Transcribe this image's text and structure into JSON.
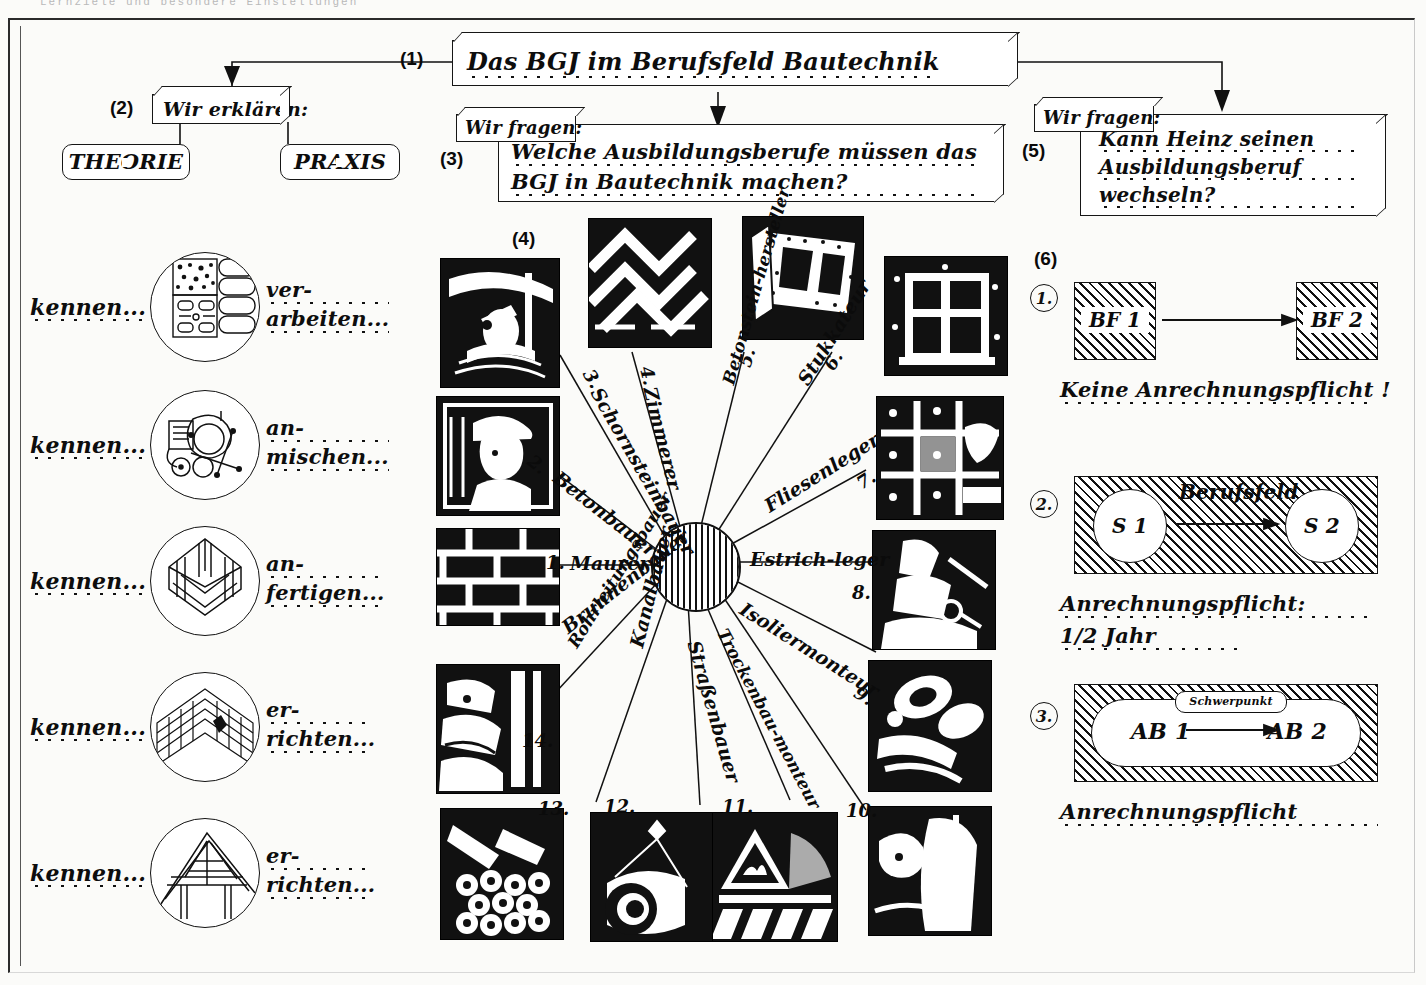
{
  "page": {
    "cut_header_text": "Lernziele und besondere Einstellungen",
    "title_label": "Das BGJ im Berufsfeld Bautechnik"
  },
  "steps": {
    "s1": "(1)",
    "s2": "(2)",
    "s3": "(3)",
    "s4": "(4)",
    "s5": "(5)",
    "s6": "(6)"
  },
  "boxes": {
    "title": {
      "text": "Das BGJ im Berufsfeld Bautechnik"
    },
    "explain_tab": {
      "text": "Wir erklären:"
    },
    "theorie": {
      "text": "THEORIE"
    },
    "praxis": {
      "text": "PRAXIS"
    },
    "ask_tab_left": {
      "text": "Wir fragen:"
    },
    "question_left_line1": "Welche Ausbildungsberufe müssen das",
    "question_left_line2": "BGJ in Bautechnik machen?",
    "ask_tab_right": {
      "text": "Wir fragen:"
    },
    "question_right_line1": "Kann Heinz seinen",
    "question_right_line2": "Ausbildungsberuf",
    "question_right_line3": "wechseln?"
  },
  "skills": [
    {
      "left": "kennen...",
      "icon": "bricks-and-blocks-icon",
      "verb_line1": "ver-",
      "verb_line2": "arbeiten..."
    },
    {
      "left": "kennen...",
      "icon": "concrete-mixer-icon",
      "verb_line1": "an-",
      "verb_line2": "mischen..."
    },
    {
      "left": "kennen...",
      "icon": "formwork-icon",
      "verb_line1": "an-",
      "verb_line2": "fertigen..."
    },
    {
      "left": "kennen...",
      "icon": "brick-corner-icon",
      "verb_line1": "er-",
      "verb_line2": "richten..."
    },
    {
      "left": "kennen...",
      "icon": "roof-truss-icon",
      "verb_line1": "er-",
      "verb_line2": "richten..."
    }
  ],
  "wheel": {
    "hub_name": "berufsfeld-hub",
    "spokes": [
      {
        "num": "1.",
        "label": "Maurer"
      },
      {
        "num": "2.",
        "label": "Betonbauer"
      },
      {
        "num": "3.",
        "label": "Schornsteinbauer"
      },
      {
        "num": "4.",
        "label": "Zimmerer"
      },
      {
        "num": "5.",
        "label": "Betonstein-hersteller"
      },
      {
        "num": "6.",
        "label": "Stukkateur"
      },
      {
        "num": "7.",
        "label": "Fliesenleger"
      },
      {
        "num": "8.",
        "label": "Estrich-leger"
      },
      {
        "num": "9.",
        "label": "Isoliermonteur"
      },
      {
        "num": "10.",
        "label": "Trockenbau-monteur"
      },
      {
        "num": "11.",
        "label": "Straßenbauer"
      },
      {
        "num": "12.",
        "label": "Kanalbauer"
      },
      {
        "num": "13.",
        "label": "Rohrleitungsbauer"
      },
      {
        "num": "14.",
        "label": "Brunnenbauer"
      }
    ]
  },
  "rules": [
    {
      "num": "1.",
      "from": "BF 1",
      "to": "BF 2",
      "band": "",
      "caption": "Keine Anrechnungspflicht !",
      "caption2": ""
    },
    {
      "num": "2.",
      "from": "S 1",
      "to": "S 2",
      "band": "Berufsfeld",
      "caption": "Anrechnungspflicht:",
      "caption2": "1/2 Jahr"
    },
    {
      "num": "3.",
      "from": "AB 1",
      "to": "AB 2",
      "band": "Schwerpunkt",
      "caption": "Anrechnungspflicht",
      "caption2": ""
    }
  ],
  "colors": {
    "ink": "#111111",
    "paper": "#fbfbf9"
  }
}
